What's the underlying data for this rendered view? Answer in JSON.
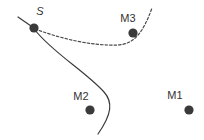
{
  "figure": {
    "kind": "trajectory-diagram",
    "background_color": "#ffffff",
    "ink_color": "#3a3a3a",
    "label_color": "#333333",
    "width": 204,
    "height": 140
  },
  "nodes": [
    {
      "id": "S",
      "label": "S",
      "style": "italic",
      "x": 34,
      "y": 28,
      "radius": 4.6,
      "label_x": 40,
      "label_y": 15
    },
    {
      "id": "M3",
      "label": "M3",
      "style": "normal",
      "x": 133,
      "y": 33,
      "radius": 4.6,
      "label_x": 121,
      "label_y": 21
    },
    {
      "id": "M2",
      "label": "M2",
      "style": "normal",
      "x": 90,
      "y": 110,
      "radius": 4.6,
      "label_x": 73,
      "label_y": 99
    },
    {
      "id": "M1",
      "label": "M1",
      "style": "normal",
      "x": 189,
      "y": 110,
      "radius": 4.6,
      "label_x": 167,
      "label_y": 98
    }
  ],
  "paths": [
    {
      "id": "dashed-trajectory",
      "style": "dashed",
      "dash_pattern": "2.5 2",
      "stroke_width": 1.2,
      "d": "M 35 29 C 62 39, 92 46, 118 45 C 134 44, 143 33, 152 8"
    },
    {
      "id": "solid-trajectory",
      "style": "solid",
      "stroke_width": 1.2,
      "d": "M 35 30 C 52 52, 86 72, 104 92 C 113 102, 112 114, 98 134"
    },
    {
      "id": "incoming-stub",
      "style": "solid",
      "stroke_width": 1.2,
      "d": "M 18 17 L 31 26"
    }
  ]
}
